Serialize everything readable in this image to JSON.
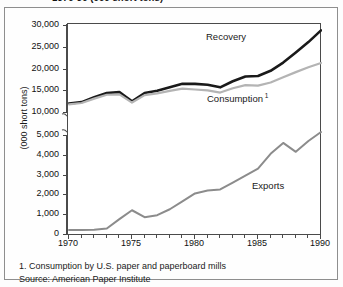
{
  "title": "1970-90 (000 short tons)",
  "footnotes": {
    "note1": "1. Consumption by U.S. paper and paperboard mills",
    "source": "Source: American Paper Institute"
  },
  "colors": {
    "recovery": "#1a1a1a",
    "consumption": "#b4b4b4",
    "exports": "#8c8c8c",
    "axis": "#4a4a4a",
    "frame": "#8e8e8e"
  },
  "chart_data": {
    "type": "line",
    "title": "1970-90 (000 short tons)",
    "xlabel": "",
    "ylabel": "(000 short tons)",
    "xlim": [
      1970,
      1990
    ],
    "ylim": [
      0,
      30000
    ],
    "broken_axis": {
      "enabled": true,
      "lower_segment": [
        0,
        5000
      ],
      "upper_segment": [
        10000,
        30000
      ]
    },
    "grid": false,
    "legend": "inline-labels",
    "xticks": [
      1970,
      1975,
      1980,
      1985,
      1990
    ],
    "xtick_labels": [
      "1970",
      "1975",
      "1980",
      "1985",
      "1990"
    ],
    "yticks": [
      0,
      1000,
      2000,
      3000,
      4000,
      5000,
      10000,
      15000,
      20000,
      25000,
      30000
    ],
    "ytick_labels": [
      "0",
      "1,000",
      "2,000",
      "3,000",
      "4,000",
      "5,000",
      "10,000",
      "15,000",
      "20,000",
      "25,000",
      "30,000"
    ],
    "x": [
      1970,
      1971,
      1972,
      1973,
      1974,
      1975,
      1976,
      1977,
      1978,
      1979,
      1980,
      1981,
      1982,
      1983,
      1984,
      1985,
      1986,
      1987,
      1988,
      1989,
      1990
    ],
    "series": [
      {
        "name": "Recovery",
        "label": "Recovery",
        "color": "#1a1a1a",
        "width": 2.6,
        "values": [
          12200,
          12500,
          13600,
          14600,
          14800,
          12700,
          14600,
          15100,
          15900,
          16700,
          16700,
          16500,
          15900,
          17300,
          18400,
          18500,
          19700,
          21600,
          23900,
          26300,
          29000
        ]
      },
      {
        "name": "Consumption",
        "label": "Consumption",
        "footnote_marker": "1",
        "color": "#b4b4b4",
        "width": 2.2,
        "values": [
          12000,
          12300,
          13300,
          14200,
          14300,
          12400,
          14100,
          14500,
          15100,
          15600,
          15400,
          15200,
          14700,
          15700,
          16400,
          16300,
          17000,
          18200,
          19400,
          20500,
          21500
        ]
      },
      {
        "name": "Exports",
        "label": "Exports",
        "color": "#8c8c8c",
        "width": 2.0,
        "values": [
          250,
          250,
          260,
          330,
          800,
          1250,
          900,
          1000,
          1300,
          1700,
          2100,
          2250,
          2300,
          2650,
          3000,
          3350,
          4100,
          4650,
          4200,
          4750,
          5200
        ]
      }
    ],
    "annotations": [
      {
        "text": "Recovery",
        "x": 1983,
        "y": 26500
      },
      {
        "text": "Consumption",
        "x": 1983.5,
        "y": 13500
      },
      {
        "text": "Exports",
        "x": 1986,
        "y": 3400
      }
    ]
  }
}
